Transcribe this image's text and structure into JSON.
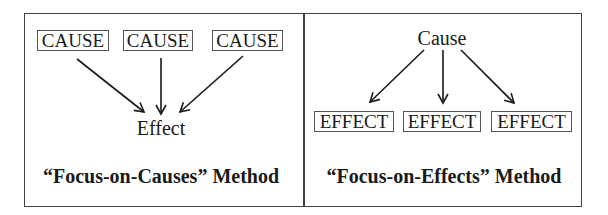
{
  "left_panel": {
    "causes": [
      "CAUSE",
      "CAUSE",
      "CAUSE"
    ],
    "effect": "Effect",
    "title": "“Focus-on-Causes” Method"
  },
  "right_panel": {
    "cause": "Cause",
    "effects": [
      "EFFECT",
      "EFFECT",
      "EFFECT"
    ],
    "title": "“Focus-on-Effects” Method"
  },
  "colors": {
    "border": "#444444",
    "arrow": "#1a1a1a",
    "text": "#1a1a1a",
    "background": "#ffffff"
  }
}
